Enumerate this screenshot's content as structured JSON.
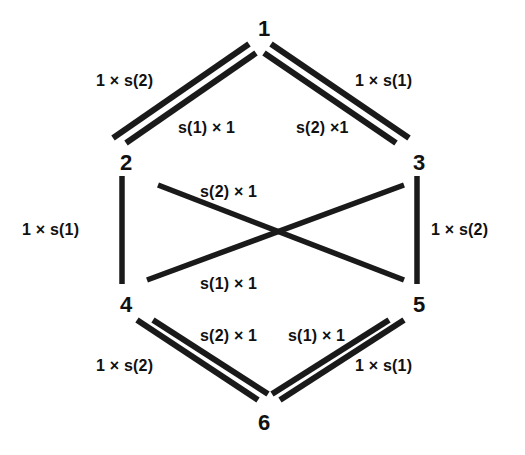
{
  "figure": {
    "kind": "hexagonal-lattice-diagram",
    "background_color": "#ffffff",
    "stroke_color": "#1a1a1a",
    "text_color": "#111111"
  },
  "nodes": [
    {
      "id": "1",
      "label": "1",
      "x": 258,
      "y": 18
    },
    {
      "id": "2",
      "label": "2",
      "x": 120,
      "y": 152
    },
    {
      "id": "3",
      "label": "3",
      "x": 413,
      "y": 152
    },
    {
      "id": "4",
      "label": "4",
      "x": 120,
      "y": 294
    },
    {
      "id": "5",
      "label": "5",
      "x": 413,
      "y": 294
    },
    {
      "id": "6",
      "label": "6",
      "x": 258,
      "y": 412
    }
  ],
  "edge_labels": [
    {
      "id": "top-left-outer",
      "text": "1 × s(2)",
      "x": 96,
      "y": 73,
      "edge": "1-2 outer"
    },
    {
      "id": "top-right-outer",
      "text": "1 × s(1)",
      "x": 355,
      "y": 73,
      "edge": "1-3 outer"
    },
    {
      "id": "top-left-inner",
      "text": "s(1) × 1",
      "x": 178,
      "y": 120,
      "edge": "1-2 inner"
    },
    {
      "id": "top-right-inner",
      "text": "s(2) ×1",
      "x": 296,
      "y": 120,
      "edge": "1-3 inner"
    },
    {
      "id": "left-vertical",
      "text": "1 × s(1)",
      "x": 22,
      "y": 222,
      "edge": "2-4"
    },
    {
      "id": "right-vertical",
      "text": "1 × s(2)",
      "x": 431,
      "y": 222,
      "edge": "3-5"
    },
    {
      "id": "cross-upper",
      "text": "s(2) × 1",
      "x": 200,
      "y": 184,
      "edge": "2-5 diagonal"
    },
    {
      "id": "cross-lower",
      "text": "s(1) × 1",
      "x": 200,
      "y": 276,
      "edge": "3-4 diagonal"
    },
    {
      "id": "bottom-inner-left",
      "text": "s(2) × 1",
      "x": 200,
      "y": 328,
      "edge": "4-6 inner"
    },
    {
      "id": "bottom-inner-right",
      "text": "s(1) × 1",
      "x": 288,
      "y": 328,
      "edge": "5-6 inner"
    },
    {
      "id": "bottom-left-outer",
      "text": "1 × s(2)",
      "x": 96,
      "y": 358,
      "edge": "4-6 outer"
    },
    {
      "id": "bottom-right-outer",
      "text": "1 × s(1)",
      "x": 355,
      "y": 358,
      "edge": "5-6 outer"
    }
  ],
  "edges": [
    {
      "id": "e-1-2-outer",
      "from": "1",
      "to": "2",
      "x1": 249,
      "y1": 44,
      "x2": 113,
      "y2": 138,
      "style": "double-outer"
    },
    {
      "id": "e-1-2-inner",
      "from": "1",
      "to": "2",
      "x1": 256,
      "y1": 53,
      "x2": 126,
      "y2": 143,
      "style": "double-inner"
    },
    {
      "id": "e-1-3-outer",
      "from": "1",
      "to": "3",
      "x1": 271,
      "y1": 44,
      "x2": 409,
      "y2": 138,
      "style": "double-outer"
    },
    {
      "id": "e-1-3-inner",
      "from": "1",
      "to": "3",
      "x1": 264,
      "y1": 53,
      "x2": 396,
      "y2": 143,
      "style": "double-inner"
    },
    {
      "id": "e-2-4",
      "from": "2",
      "to": "4",
      "x1": 122,
      "y1": 176,
      "x2": 122,
      "y2": 284,
      "style": "single"
    },
    {
      "id": "e-3-5",
      "from": "3",
      "to": "5",
      "x1": 417,
      "y1": 176,
      "x2": 417,
      "y2": 284,
      "style": "single"
    },
    {
      "id": "e-2-5",
      "from": "2",
      "to": "5",
      "x1": 158,
      "y1": 185,
      "x2": 404,
      "y2": 280,
      "style": "single"
    },
    {
      "id": "e-3-4",
      "from": "3",
      "to": "4",
      "x1": 404,
      "y1": 185,
      "x2": 147,
      "y2": 280,
      "style": "single"
    },
    {
      "id": "e-4-6-outer",
      "from": "4",
      "to": "6",
      "x1": 137,
      "y1": 320,
      "x2": 258,
      "y2": 400,
      "style": "double-outer"
    },
    {
      "id": "e-4-6-inner",
      "from": "4",
      "to": "6",
      "x1": 153,
      "y1": 320,
      "x2": 268,
      "y2": 394,
      "style": "double-inner"
    },
    {
      "id": "e-5-6-outer",
      "from": "5",
      "to": "6",
      "x1": 404,
      "y1": 320,
      "x2": 280,
      "y2": 400,
      "style": "double-outer"
    },
    {
      "id": "e-5-6-inner",
      "from": "5",
      "to": "6",
      "x1": 389,
      "y1": 320,
      "x2": 272,
      "y2": 394,
      "style": "double-inner"
    }
  ]
}
